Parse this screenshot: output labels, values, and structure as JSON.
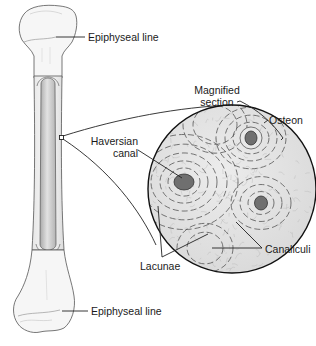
{
  "figure": {
    "labels": {
      "epiphyseal_top": "Epiphyseal line",
      "epiphyseal_bottom": "Epiphyseal line",
      "magnified_line1": "Magnified",
      "magnified_line2": "section",
      "osteon": "Osteon",
      "haversian_line1": "Haversian",
      "haversian_line2": "canal",
      "canaliculi": "Canaliculi",
      "lacunae": "Lacunae"
    },
    "colors": {
      "outline": "#1a1a1a",
      "bone_fill": "#f4f4f4",
      "shaft_cavity": "#c9c9c9",
      "section_fill": "#e6e6e6",
      "canal_fill": "#6f6f6f"
    }
  }
}
